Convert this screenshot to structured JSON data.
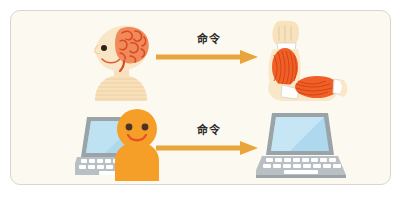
{
  "figure": {
    "title": "",
    "card": {
      "background_color": "#fcfaf0",
      "border_color": "#d9d6cc"
    },
    "rows": [
      {
        "id": "biological-row",
        "source": {
          "name": "head-with-brain",
          "alt": "Side profile of a human head showing the brain",
          "skin_color": "#f6dfb8",
          "brain_color": "#e8603c"
        },
        "arrow": {
          "label": "命令",
          "color": "#e9a43b",
          "direction": "right"
        },
        "target": {
          "name": "flexed-arm-muscles",
          "alt": "Arm with exposed biceps muscle flexing",
          "skin_color": "#f6e2bd",
          "muscle_color": "#ea5b2a"
        }
      },
      {
        "id": "computer-row",
        "source": {
          "name": "person-at-laptop",
          "alt": "Smiling orange person sitting at an open laptop",
          "person_color": "#f59f28",
          "eye_color": "#4a3325",
          "mouth_color": "#e8522a",
          "laptop_body_color": "#9aa3a8",
          "laptop_screen_color": "#aed8ee"
        },
        "arrow": {
          "label": "命令",
          "color": "#e9a43b",
          "direction": "right"
        },
        "target": {
          "name": "laptop-computer",
          "alt": "Open laptop computer",
          "laptop_body_color": "#9aa3a8",
          "laptop_screen_color": "#aed8ee"
        }
      }
    ]
  }
}
